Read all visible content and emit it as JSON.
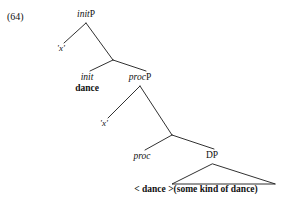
{
  "figure": {
    "example_number": "(64)",
    "type": "syntax-tree",
    "line_color": "#1a1a1a"
  },
  "nodes": {
    "root": {
      "head": "init",
      "category": "P",
      "full_label": "initP"
    },
    "spec_init": {
      "label": "'x'"
    },
    "init_head": {
      "head": "init",
      "category": "",
      "full_label": "init"
    },
    "init_word": {
      "label": "dance"
    },
    "procP": {
      "head": "proc",
      "category": "P",
      "full_label": "procP"
    },
    "spec_proc": {
      "label": "'x'"
    },
    "proc_head": {
      "head": "proc",
      "category": "",
      "full_label": "proc"
    },
    "dp": {
      "head": "",
      "category": "DP",
      "full_label": "DP"
    },
    "dp_complement": {
      "label": "< dance >(some kind of dance)"
    }
  }
}
